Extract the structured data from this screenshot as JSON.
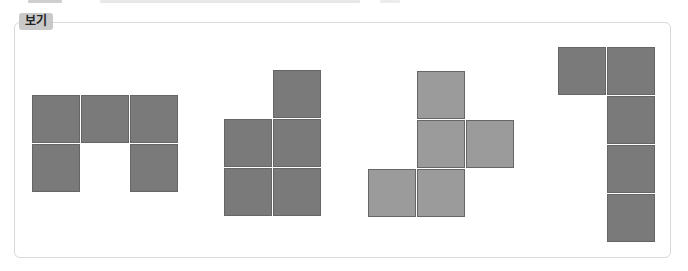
{
  "header": {
    "label": "보기"
  },
  "figures": [
    {
      "name": "figure-1",
      "shade": "dark",
      "cells": [
        [
          0,
          0
        ],
        [
          1,
          0
        ],
        [
          2,
          0
        ],
        [
          0,
          1
        ],
        [
          2,
          1
        ]
      ],
      "origin": [
        32,
        95
      ]
    },
    {
      "name": "figure-2",
      "shade": "dark",
      "cells": [
        [
          1,
          0
        ],
        [
          0,
          1
        ],
        [
          1,
          1
        ],
        [
          0,
          2
        ],
        [
          1,
          2
        ]
      ],
      "origin": [
        224,
        70
      ]
    },
    {
      "name": "figure-3",
      "shade": "light",
      "cells": [
        [
          1,
          0
        ],
        [
          1,
          1
        ],
        [
          2,
          1
        ],
        [
          0,
          2
        ],
        [
          1,
          2
        ]
      ],
      "origin": [
        368,
        71
      ]
    },
    {
      "name": "figure-4",
      "shade": "dark",
      "cells": [
        [
          0,
          0
        ],
        [
          1,
          0
        ],
        [
          1,
          1
        ],
        [
          1,
          2
        ],
        [
          1,
          3
        ]
      ],
      "origin": [
        558,
        47
      ]
    }
  ],
  "colors": {
    "dark": "#7a7a7a",
    "light": "#9b9b9b",
    "border": "#d9d9d9",
    "label_bg": "#c9c9c9"
  }
}
